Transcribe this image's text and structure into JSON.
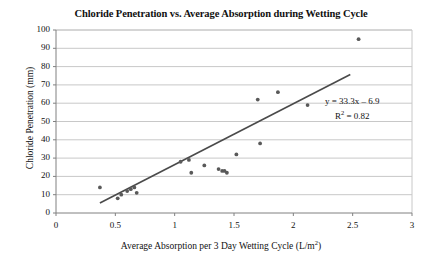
{
  "chart_data": {
    "type": "scatter",
    "title": "Chloride Penetration vs. Average Absorption during Wetting Cycle",
    "xlabel": "Average Absorption per 3 Day Wetting Cycle (L/m2)",
    "xlabel_prefix": "Average Absorption per 3 Day Wetting Cycle (L/m",
    "xlabel_sup": "2",
    "xlabel_suffix": ")",
    "ylabel": "Chloride Penetration (mm)",
    "xlim": [
      0,
      3
    ],
    "ylim": [
      0,
      100
    ],
    "xticks": [
      "0",
      "0.5",
      "1",
      "1.5",
      "2",
      "2.5",
      "3"
    ],
    "xtick_values": [
      0,
      0.5,
      1,
      1.5,
      2,
      2.5,
      3
    ],
    "yticks": [
      "0",
      "10",
      "20",
      "30",
      "40",
      "50",
      "60",
      "70",
      "80",
      "90",
      "100"
    ],
    "ytick_values": [
      0,
      10,
      20,
      30,
      40,
      50,
      60,
      70,
      80,
      90,
      100
    ],
    "grid": "horizontal",
    "legend": "none",
    "marker_color": "#595959",
    "trendline_color": "#4a4a4a",
    "gridline_color": "#c8c8c8",
    "axis_color": "#808080",
    "points": [
      {
        "x": 0.37,
        "y": 14
      },
      {
        "x": 0.52,
        "y": 8
      },
      {
        "x": 0.55,
        "y": 10
      },
      {
        "x": 0.6,
        "y": 12
      },
      {
        "x": 0.63,
        "y": 13
      },
      {
        "x": 0.66,
        "y": 14
      },
      {
        "x": 0.68,
        "y": 11
      },
      {
        "x": 1.05,
        "y": 28
      },
      {
        "x": 1.12,
        "y": 29
      },
      {
        "x": 1.14,
        "y": 22
      },
      {
        "x": 1.25,
        "y": 26
      },
      {
        "x": 1.37,
        "y": 24
      },
      {
        "x": 1.4,
        "y": 23
      },
      {
        "x": 1.42,
        "y": 23
      },
      {
        "x": 1.44,
        "y": 22
      },
      {
        "x": 1.52,
        "y": 32
      },
      {
        "x": 1.7,
        "y": 62
      },
      {
        "x": 1.72,
        "y": 38
      },
      {
        "x": 1.87,
        "y": 66
      },
      {
        "x": 2.12,
        "y": 59
      },
      {
        "x": 2.55,
        "y": 95
      }
    ],
    "trendline": {
      "equation": "y = 33.3x – 6.9",
      "r_squared_label": "R",
      "r_squared_sup": "2",
      "r_squared_value": " = 0.82",
      "slope": 33.3,
      "intercept": -6.9,
      "x_start": 0.37,
      "x_end": 2.48
    }
  }
}
